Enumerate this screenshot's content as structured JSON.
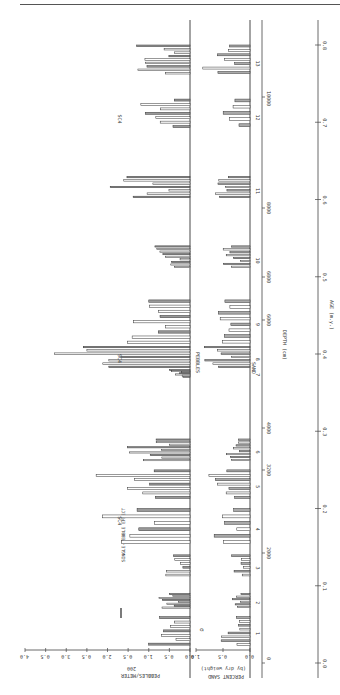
{
  "page": {
    "header_text": "",
    "orientation": "rotated 90° counter-clockwise"
  },
  "chart_data": {
    "type": "bar",
    "title": "",
    "orientation": "horizontal bars (figure rotated)",
    "panels": [
      {
        "name": "Pebbles",
        "label": "PEBBLES",
        "axis_label": "PEBBLES/METER",
        "axis_break_label": "200",
        "ticks": [
          "0.0",
          "0.5",
          "1.0",
          "0.5",
          "2.0",
          "0.5",
          "3.0",
          "0.5",
          "4.0"
        ],
        "xlim": [
          0,
          4.0
        ],
        "scale_bar_label": "SINGLE-PEBBLE EFFECT"
      },
      {
        "name": "Sand",
        "label": "SAND",
        "axis_label": "PERCENT SAND",
        "axis_sublabel": "(by dry weight)",
        "ticks": [
          "0.0",
          "0.5",
          "1.0"
        ],
        "xlim": [
          0,
          1.0
        ],
        "error_bar_label": "σ"
      }
    ],
    "depth_axis": {
      "label": "DEPTH (cm)",
      "ticks": [
        "0",
        "2000",
        "3200",
        "4000",
        "6000",
        "6800",
        "8000",
        "10000"
      ],
      "interval_labels": [
        "1",
        "2",
        "3",
        "4",
        "5",
        "6",
        "7",
        "8",
        "9",
        "10",
        "11",
        "12",
        "13"
      ]
    },
    "age_axis": {
      "label": "AGE (m.y.)",
      "ticks": [
        "0.0",
        "0.1",
        "0.2",
        "0.3",
        "0.4",
        "0.5",
        "0.6",
        "0.7",
        "0.8"
      ],
      "range": [
        0.0,
        0.8
      ]
    },
    "annotations": [
      {
        "text": "SC4",
        "age_approx": 0.19
      },
      {
        "text": "SC4",
        "age_approx": 0.4
      },
      {
        "text": "SC4",
        "age_approx": 0.71
      }
    ],
    "series": [
      {
        "name": "Pebbles/meter episodes",
        "intervals": [
          {
            "id": "1",
            "age_start": 0.02,
            "age_end": 0.06,
            "peak": 1.1
          },
          {
            "id": "2",
            "age_start": 0.07,
            "age_end": 0.09,
            "peak": 0.9
          },
          {
            "id": "3",
            "age_start": 0.11,
            "age_end": 0.14,
            "peak": 0.6
          },
          {
            "id": "4",
            "age_start": 0.15,
            "age_end": 0.2,
            "peak": 2.2
          },
          {
            "id": "5",
            "age_start": 0.21,
            "age_end": 0.25,
            "peak": 2.3
          },
          {
            "id": "6",
            "age_start": 0.26,
            "age_end": 0.29,
            "peak": 1.6
          },
          {
            "id": "7",
            "age_start": 0.37,
            "age_end": 0.38,
            "peak": 0.6
          },
          {
            "id": "8",
            "age_start": 0.38,
            "age_end": 0.41,
            "peak": 3.4
          },
          {
            "id": "9",
            "age_start": 0.41,
            "age_end": 0.47,
            "peak": 1.7
          },
          {
            "id": "10",
            "age_start": 0.51,
            "age_end": 0.54,
            "peak": 0.9
          },
          {
            "id": "11",
            "age_start": 0.6,
            "age_end": 0.63,
            "peak": 2.0
          },
          {
            "id": "12",
            "age_start": 0.69,
            "age_end": 0.73,
            "peak": 1.2
          },
          {
            "id": "13",
            "age_start": 0.76,
            "age_end": 0.8,
            "peak": 1.4
          }
        ]
      },
      {
        "name": "Percent sand episodes",
        "intervals": [
          {
            "id": "1",
            "peak": 0.6
          },
          {
            "id": "2",
            "peak": 0.5
          },
          {
            "id": "3",
            "peak": 0.4
          },
          {
            "id": "4",
            "peak": 0.8
          },
          {
            "id": "5",
            "peak": 0.8
          },
          {
            "id": "6",
            "peak": 0.6
          },
          {
            "id": "8",
            "peak": 0.9
          },
          {
            "id": "9",
            "peak": 0.6
          },
          {
            "id": "10",
            "peak": 0.5
          },
          {
            "id": "11",
            "peak": 0.7
          },
          {
            "id": "12",
            "peak": 0.5
          },
          {
            "id": "13",
            "peak": 0.9
          }
        ]
      }
    ]
  }
}
